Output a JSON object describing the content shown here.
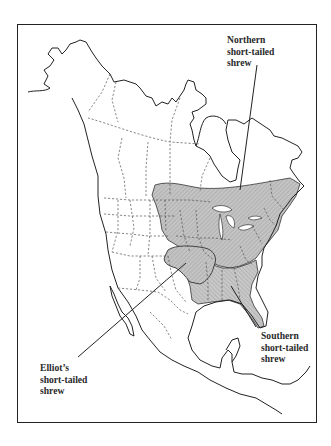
{
  "map": {
    "type": "range map",
    "region": "North America",
    "colors": {
      "range_fill": "#bdbdbd",
      "coastline": "#222222",
      "political_border": "#555555",
      "frame": "#222222",
      "background": "#ffffff"
    },
    "labels": {
      "northern": {
        "line1": "Northern",
        "line2": "short-tailed",
        "line3": "shrew"
      },
      "southern": {
        "line1": "Southern",
        "line2": "short-tailed",
        "line3": "shrew"
      },
      "elliots": {
        "line1": "Elliot’s",
        "line2": "short-tailed",
        "line3": "shrew"
      }
    }
  }
}
